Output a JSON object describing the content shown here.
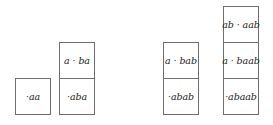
{
  "diagram": {
    "columns": [
      {
        "id": "col-1",
        "cells": [
          "·aa"
        ]
      },
      {
        "id": "col-2",
        "cells": [
          "a · ba",
          "·aba"
        ]
      },
      {
        "id": "col-3",
        "cells": [
          "a · bab",
          "·abab"
        ]
      },
      {
        "id": "col-4",
        "cells": [
          "ab · aab",
          "a · baab",
          "·abaab"
        ]
      }
    ],
    "colors": {
      "border": "#6e6e6e",
      "text": "#222222",
      "background": "#ffffff"
    }
  }
}
